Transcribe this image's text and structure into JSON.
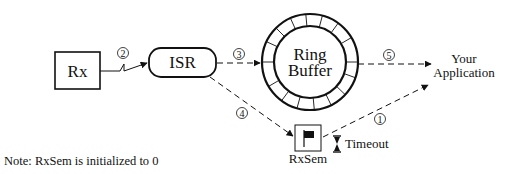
{
  "diagram": {
    "nodes": {
      "rx": {
        "label": "Rx"
      },
      "isr": {
        "label": "ISR"
      },
      "ring_buffer": {
        "label_line1": "Ring",
        "label_line2": "Buffer"
      },
      "app": {
        "label_line1": "Your",
        "label_line2": "Application"
      },
      "rxsem": {
        "label": "RxSem",
        "icon": "flag-icon"
      },
      "timeout": {
        "label": "Timeout",
        "icon": "hourglass-icon"
      }
    },
    "edges": [
      {
        "step": "1",
        "from": "RxSem",
        "to": "Your Application",
        "style": "dashed"
      },
      {
        "step": "2",
        "from": "Rx",
        "to": "ISR",
        "style": "solid-interrupt"
      },
      {
        "step": "3",
        "from": "ISR",
        "to": "Ring Buffer",
        "style": "dashed"
      },
      {
        "step": "4",
        "from": "ISR",
        "to": "RxSem",
        "style": "dashed"
      },
      {
        "step": "5",
        "from": "Ring Buffer",
        "to": "Your Application",
        "style": "dashed"
      }
    ],
    "note": "Note: RxSem is initialized to 0"
  },
  "colors": {
    "stroke": "#111111",
    "background": "#ffffff"
  }
}
